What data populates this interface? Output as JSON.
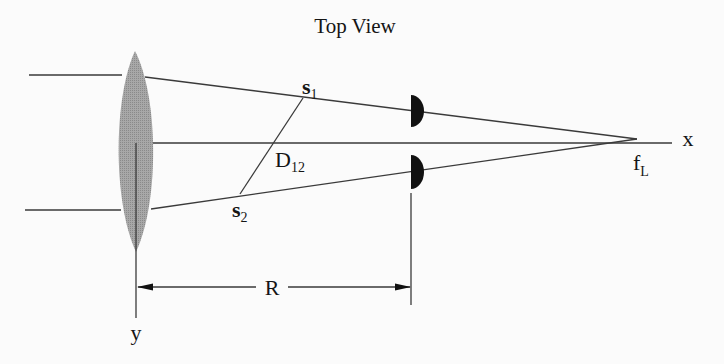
{
  "title": "Top View",
  "labels": {
    "x_axis": "x",
    "y_axis": "y",
    "focal_point": "f",
    "focal_point_sub": "L",
    "source1": "s",
    "source1_sub": "1",
    "source2": "s",
    "source2_sub": "2",
    "separation": "D",
    "separation_sub": "12",
    "distance": "R"
  },
  "colors": {
    "background": "#fbfbfb",
    "lens": "#9a9a9a",
    "lines": "#3a3a3a",
    "detector": "#111111",
    "text": "#151515"
  },
  "components": {
    "lens": "converging-lens",
    "detectors": [
      "detector-1",
      "detector-2"
    ]
  }
}
